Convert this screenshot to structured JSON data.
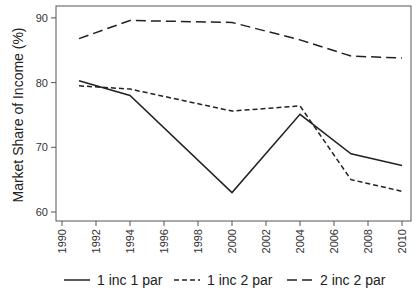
{
  "chart_data": {
    "type": "line",
    "title": "",
    "xlabel": "",
    "ylabel": "Market Share of Income (%)",
    "x": [
      1991,
      1994,
      2000,
      2004,
      2007,
      2010
    ],
    "xticks": [
      "1990",
      "1992",
      "1994",
      "1996",
      "1998",
      "2000",
      "2002",
      "2004",
      "2006",
      "2008",
      "2010"
    ],
    "yticks": [
      "60",
      "70",
      "80",
      "90"
    ],
    "xlim": [
      1990,
      2010
    ],
    "ylim": [
      60,
      90
    ],
    "grid": false,
    "legend_position": "bottom",
    "series": [
      {
        "name": "1 inc 1 par",
        "style": "solid",
        "values": [
          80.3,
          78.0,
          63.0,
          75.1,
          69.0,
          67.2
        ]
      },
      {
        "name": "1 inc 2 par",
        "style": "short-dash",
        "values": [
          79.5,
          79.0,
          75.6,
          76.4,
          65.0,
          63.2
        ]
      },
      {
        "name": "2 inc 2 par",
        "style": "long-dash",
        "values": [
          86.8,
          89.6,
          89.3,
          86.6,
          84.1,
          83.8
        ]
      }
    ]
  }
}
